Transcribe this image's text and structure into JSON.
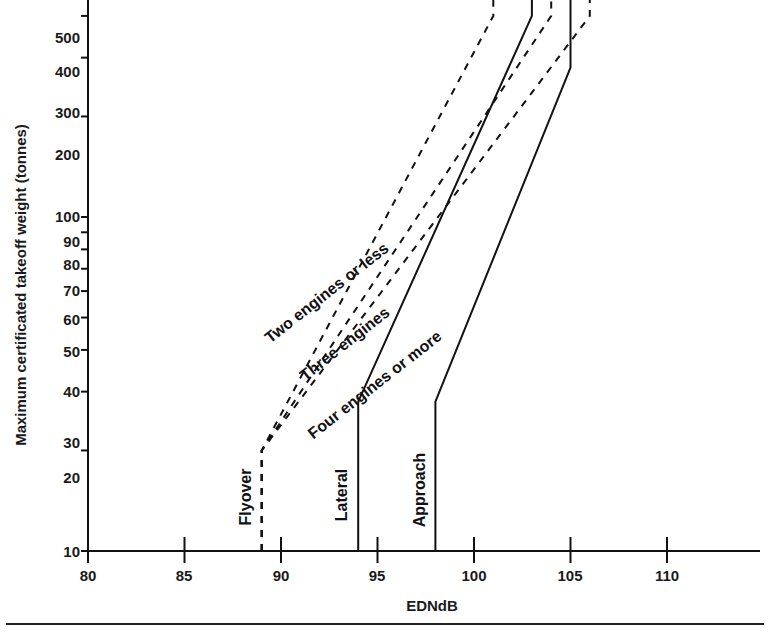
{
  "chart_data": {
    "type": "line",
    "title": "",
    "xlabel": "EDNdB",
    "ylabel": "Maximum certificated takeoff weight (tonnes)",
    "xlim": [
      80,
      113.5
    ],
    "ylim": [
      10,
      600
    ],
    "yscale": "log",
    "xticks": [
      80,
      85,
      90,
      95,
      100,
      105,
      110
    ],
    "xtick_labels": [
      "80",
      "85",
      "90",
      "95",
      "100",
      "105",
      "110"
    ],
    "yticks": [
      10,
      20,
      30,
      40,
      50,
      60,
      70,
      80,
      90,
      100,
      200,
      300,
      400,
      500
    ],
    "ytick_labels": [
      "10",
      "20",
      "30",
      "40",
      "50",
      "60",
      "70",
      "80",
      "90",
      "100",
      "200",
      "300",
      "400",
      "500"
    ],
    "grid": false,
    "legend_position": "inline-annotations",
    "series": [
      {
        "name": "Flyover - Two engines or less",
        "measure": "Flyover",
        "engines": "Two engines or less",
        "style": "dashed",
        "points": [
          [
            89,
            10
          ],
          [
            89,
            20
          ],
          [
            101,
            400
          ],
          [
            101,
            600
          ]
        ]
      },
      {
        "name": "Flyover - Three engines",
        "measure": "Flyover",
        "engines": "Three engines",
        "style": "dashed",
        "points": [
          [
            89,
            10
          ],
          [
            89,
            20
          ],
          [
            104,
            400
          ],
          [
            104,
            600
          ]
        ]
      },
      {
        "name": "Flyover - Four engines or more",
        "measure": "Flyover",
        "engines": "Four engines or more",
        "style": "dashed",
        "points": [
          [
            89,
            10
          ],
          [
            89,
            20
          ],
          [
            106,
            400
          ],
          [
            106,
            600
          ]
        ]
      },
      {
        "name": "Lateral",
        "measure": "Lateral",
        "engines": "all",
        "style": "solid",
        "points": [
          [
            94,
            10
          ],
          [
            94,
            28
          ],
          [
            103,
            400
          ],
          [
            103,
            600
          ]
        ]
      },
      {
        "name": "Approach",
        "measure": "Approach",
        "engines": "all",
        "style": "solid",
        "points": [
          [
            98,
            10
          ],
          [
            98,
            28
          ],
          [
            105,
            280
          ],
          [
            105,
            600
          ]
        ]
      }
    ],
    "annotations": [
      {
        "text": "Two engines or less",
        "x": 92.5,
        "y": 62,
        "rotation": -38
      },
      {
        "text": "Three engines",
        "x": 93.6,
        "y": 33,
        "rotation": -38
      },
      {
        "text": "Four engines or more",
        "x": 95.2,
        "y": 25,
        "rotation": -38
      },
      {
        "text": "Flyover",
        "x": 88.4,
        "y": 15.5,
        "rotation": -90
      },
      {
        "text": "Lateral",
        "x": 93.4,
        "y": 15.5,
        "rotation": -90
      },
      {
        "text": "Approach",
        "x": 97.4,
        "y": 15.0,
        "rotation": -90
      }
    ]
  },
  "figure": {
    "axis_y_title": "Maximum certificated takeoff weight (tonnes)",
    "axis_x_title": "EDNdB",
    "curve_labels": {
      "two": "Two engines or less",
      "three": "Three engines",
      "four": "Four engines or more"
    },
    "series_labels": {
      "flyover": "Flyover",
      "lateral": "Lateral",
      "approach": "Approach"
    },
    "ytick_labels": {
      "t500": "500",
      "t400": "400",
      "t300": "300",
      "t200": "200",
      "t100": "100",
      "t90": "90",
      "t80": "80",
      "t70": "70",
      "t60": "60",
      "t50": "50",
      "t40": "40",
      "t30": "30",
      "t20": "20",
      "t10": "10"
    },
    "xtick_labels": {
      "t80": "80",
      "t85": "85",
      "t90": "90",
      "t95": "95",
      "t100": "100",
      "t105": "105",
      "t110": "110"
    },
    "colors": {
      "ink": "#111111",
      "background": "#ffffff",
      "rule": "#222222"
    }
  }
}
